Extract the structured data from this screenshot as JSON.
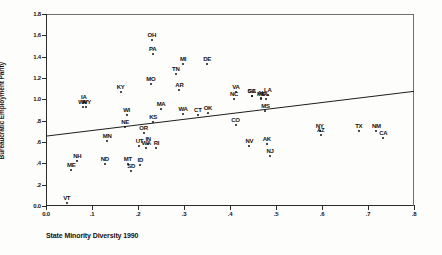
{
  "chart_data": {
    "type": "scatter",
    "title": "",
    "xlabel": "State Minority Diversity 1990",
    "ylabel": "Bureaucratic Employment Parity",
    "xlim": [
      0.0,
      0.8
    ],
    "ylim": [
      0.0,
      1.8
    ],
    "grid": false,
    "legend": null,
    "xticks": [
      "0.0",
      ".1",
      ".2",
      ".3",
      ".4",
      ".5",
      ".6",
      ".7",
      ".8"
    ],
    "xtick_values": [
      0.0,
      0.1,
      0.2,
      0.3,
      0.4,
      0.5,
      0.6,
      0.7,
      0.8
    ],
    "yticks": [
      "0.0",
      ".2",
      ".4",
      ".6",
      ".8",
      "1.0",
      "1.2",
      "1.4",
      "1.6",
      "1.8"
    ],
    "ytick_values": [
      0.0,
      0.2,
      0.4,
      0.6,
      0.8,
      1.0,
      1.2,
      1.4,
      1.6,
      1.8
    ],
    "point_labels_shown": true,
    "fit_line": {
      "type": "linear",
      "x_start": 0.0,
      "y_start": 0.655,
      "x_end": 0.8,
      "y_end": 1.075
    },
    "points": [
      {
        "label": "VT",
        "x": 0.045,
        "y": 0.025
      },
      {
        "label": "ME",
        "x": 0.055,
        "y": 0.335
      },
      {
        "label": "NH",
        "x": 0.068,
        "y": 0.425
      },
      {
        "label": "ND",
        "x": 0.128,
        "y": 0.395
      },
      {
        "label": "MN",
        "x": 0.133,
        "y": 0.605
      },
      {
        "label": "IA",
        "x": 0.082,
        "y": 0.975
      },
      {
        "label": "WV",
        "x": 0.08,
        "y": 0.925
      },
      {
        "label": "WY",
        "x": 0.088,
        "y": 0.925
      },
      {
        "label": "KY",
        "x": 0.162,
        "y": 1.065
      },
      {
        "label": "WI",
        "x": 0.175,
        "y": 0.855
      },
      {
        "label": "NE",
        "x": 0.172,
        "y": 0.745
      },
      {
        "label": "MT",
        "x": 0.178,
        "y": 0.39
      },
      {
        "label": "SD",
        "x": 0.185,
        "y": 0.325
      },
      {
        "label": "ID",
        "x": 0.205,
        "y": 0.385
      },
      {
        "label": "UT",
        "x": 0.203,
        "y": 0.565
      },
      {
        "label": "OR",
        "x": 0.212,
        "y": 0.68
      },
      {
        "label": "IN",
        "x": 0.222,
        "y": 0.58
      },
      {
        "label": "WA",
        "x": 0.218,
        "y": 0.545
      },
      {
        "label": "RI",
        "x": 0.24,
        "y": 0.54
      },
      {
        "label": "OH",
        "x": 0.23,
        "y": 1.555
      },
      {
        "label": "PA",
        "x": 0.232,
        "y": 1.425
      },
      {
        "label": "MO",
        "x": 0.228,
        "y": 1.145
      },
      {
        "label": "KS",
        "x": 0.233,
        "y": 0.79
      },
      {
        "label": "MA",
        "x": 0.25,
        "y": 0.905
      },
      {
        "label": "TN",
        "x": 0.282,
        "y": 1.235
      },
      {
        "label": "AR",
        "x": 0.29,
        "y": 1.085
      },
      {
        "label": "MI",
        "x": 0.298,
        "y": 1.335
      },
      {
        "label": "WA2",
        "x": 0.298,
        "y": 0.865
      },
      {
        "label": "CT",
        "x": 0.33,
        "y": 0.855
      },
      {
        "label": "OK",
        "x": 0.352,
        "y": 0.87
      },
      {
        "label": "DE",
        "x": 0.35,
        "y": 1.33
      },
      {
        "label": "VA",
        "x": 0.413,
        "y": 1.065
      },
      {
        "label": "NC",
        "x": 0.409,
        "y": 1.005
      },
      {
        "label": "CO",
        "x": 0.412,
        "y": 0.76
      },
      {
        "label": "GA",
        "x": 0.447,
        "y": 1.035
      },
      {
        "label": "SC",
        "x": 0.447,
        "y": 1.035
      },
      {
        "label": "AL",
        "x": 0.468,
        "y": 1.015
      },
      {
        "label": "MD",
        "x": 0.468,
        "y": 1.005
      },
      {
        "label": "FL",
        "x": 0.478,
        "y": 1.0
      },
      {
        "label": "LA",
        "x": 0.482,
        "y": 1.045
      },
      {
        "label": "MS",
        "x": 0.477,
        "y": 0.895
      },
      {
        "label": "NV",
        "x": 0.442,
        "y": 0.565
      },
      {
        "label": "AK",
        "x": 0.48,
        "y": 0.58
      },
      {
        "label": "NJ",
        "x": 0.487,
        "y": 0.47
      },
      {
        "label": "NY",
        "x": 0.595,
        "y": 0.7
      },
      {
        "label": "AZ",
        "x": 0.597,
        "y": 0.665
      },
      {
        "label": "TX",
        "x": 0.68,
        "y": 0.7
      },
      {
        "label": "NM",
        "x": 0.718,
        "y": 0.7
      },
      {
        "label": "CA",
        "x": 0.733,
        "y": 0.64
      }
    ]
  }
}
